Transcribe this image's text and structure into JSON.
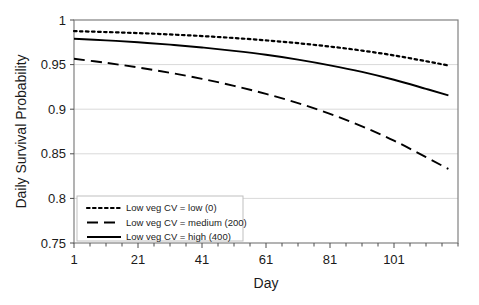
{
  "chart_data": {
    "type": "line",
    "title": "",
    "xlabel": "Day",
    "ylabel": "Daily Survival Probability",
    "xlim": [
      1,
      121
    ],
    "ylim": [
      0.75,
      1.0
    ],
    "xticks": [
      "1",
      "21",
      "41",
      "61",
      "81",
      "101"
    ],
    "xtick_values": [
      1,
      21,
      41,
      61,
      81,
      101
    ],
    "yticks": [
      "0.75",
      "0.8",
      "0.85",
      "0.9",
      "0.95",
      "1"
    ],
    "ytick_values": [
      0.75,
      0.8,
      0.85,
      0.9,
      0.95,
      1.0
    ],
    "grid": "horizontal",
    "legend_position": "bottom-left",
    "x": [
      1,
      11,
      21,
      31,
      41,
      51,
      61,
      71,
      81,
      91,
      101,
      111,
      118
    ],
    "series": [
      {
        "name": "Low veg CV = low (0)",
        "style": "dotted",
        "color": "#000000",
        "values": [
          0.9875,
          0.9865,
          0.9853,
          0.9838,
          0.982,
          0.9798,
          0.9772,
          0.974,
          0.9702,
          0.9657,
          0.9603,
          0.9538,
          0.949
        ]
      },
      {
        "name": "Low veg CV = medium (200)",
        "style": "dashed",
        "color": "#000000",
        "values": [
          0.9565,
          0.952,
          0.9468,
          0.9408,
          0.934,
          0.9262,
          0.9172,
          0.9068,
          0.8948,
          0.8808,
          0.8648,
          0.8462,
          0.833
        ]
      },
      {
        "name": "Low veg CV = high (400)",
        "style": "solid",
        "color": "#000000",
        "values": [
          0.979,
          0.9772,
          0.975,
          0.9724,
          0.9692,
          0.9654,
          0.961,
          0.9556,
          0.9492,
          0.9418,
          0.933,
          0.9228,
          0.9155
        ]
      }
    ]
  },
  "legend": {
    "items": [
      {
        "label": "Low veg CV = low (0)",
        "style": "dotted"
      },
      {
        "label": "Low veg CV = medium (200)",
        "style": "dashed"
      },
      {
        "label": "Low veg CV = high (400)",
        "style": "solid"
      }
    ]
  },
  "axes": {
    "y_title": "Daily Survival Probability",
    "x_title": "Day"
  }
}
